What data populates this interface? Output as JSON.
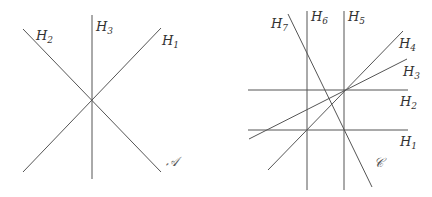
{
  "arrangements": [
    {
      "name": "A",
      "label": "𝒜",
      "label_pos": [
        166,
        166
      ],
      "lines": [
        {
          "id": "H1",
          "label": "H",
          "sub": "1",
          "x1": 23,
          "y1": 172,
          "x2": 161,
          "y2": 28,
          "lx": 162,
          "ly": 45
        },
        {
          "id": "H2",
          "label": "H",
          "sub": "2",
          "x1": 23,
          "y1": 29,
          "x2": 161,
          "y2": 172,
          "lx": 36,
          "ly": 40
        },
        {
          "id": "H3",
          "label": "H",
          "sub": "3",
          "x1": 92,
          "y1": 15,
          "x2": 92,
          "y2": 179,
          "lx": 96,
          "ly": 31
        }
      ]
    },
    {
      "name": "C",
      "label": "𝒞",
      "label_pos": [
        374,
        167
      ],
      "lines": [
        {
          "id": "H1",
          "label": "H",
          "sub": "1",
          "x1": 248,
          "y1": 130,
          "x2": 408,
          "y2": 130,
          "lx": 400,
          "ly": 146
        },
        {
          "id": "H2",
          "label": "H",
          "sub": "2",
          "x1": 248,
          "y1": 90,
          "x2": 408,
          "y2": 90,
          "lx": 400,
          "ly": 106
        },
        {
          "id": "H3",
          "label": "H",
          "sub": "3",
          "x1": 249,
          "y1": 139,
          "x2": 407,
          "y2": 59,
          "lx": 403,
          "ly": 76
        },
        {
          "id": "H4",
          "label": "H",
          "sub": "4",
          "x1": 268,
          "y1": 170,
          "x2": 403,
          "y2": 31,
          "lx": 399,
          "ly": 48
        },
        {
          "id": "H5",
          "label": "H",
          "sub": "5",
          "x1": 344,
          "y1": 11,
          "x2": 344,
          "y2": 190,
          "lx": 348,
          "ly": 21
        },
        {
          "id": "H6",
          "label": "H",
          "sub": "6",
          "x1": 307,
          "y1": 11,
          "x2": 307,
          "y2": 190,
          "lx": 311,
          "ly": 21
        },
        {
          "id": "H7",
          "label": "H",
          "sub": "7",
          "x1": 288,
          "y1": 14,
          "x2": 372,
          "y2": 187,
          "lx": 271,
          "ly": 28
        }
      ]
    }
  ]
}
